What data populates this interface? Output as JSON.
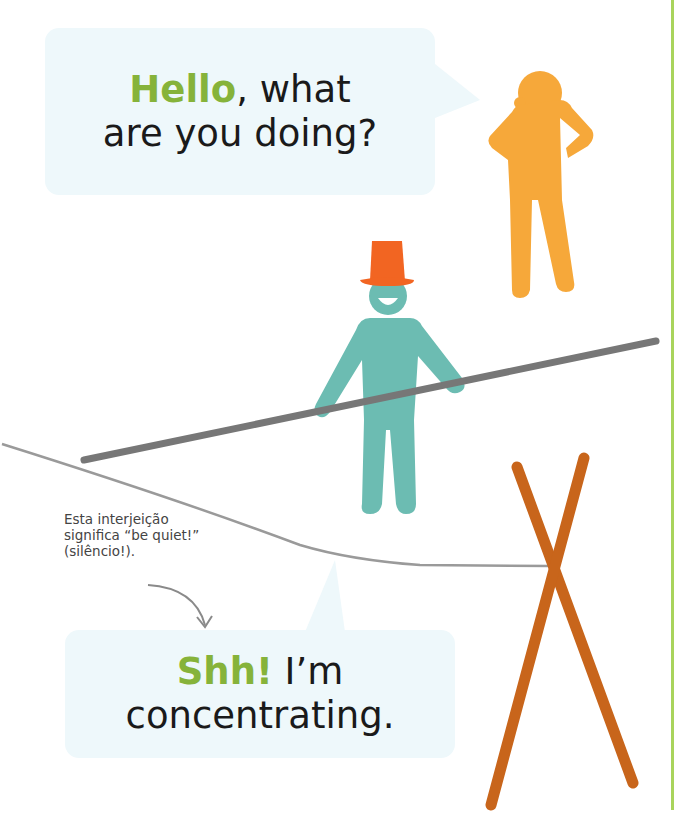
{
  "top_bubble": {
    "accent_word": "Hello",
    "line1_rest": ", what",
    "line2": "are you doing?"
  },
  "note": {
    "line1": "Esta interjeição",
    "line2": "significa “be quiet!”",
    "line3": "(silêncio!)."
  },
  "bottom_bubble": {
    "accent_word": "Shh!",
    "line1_rest": " I’m",
    "line2": "concentrating."
  },
  "colors": {
    "accent_green": "#86b33a",
    "bubble_bg": "#eef8fb",
    "orange_figure": "#f6a83a",
    "teal_figure": "#6cbcb2",
    "hat": "#f26522",
    "pole": "#777777",
    "stick": "#c8651b",
    "divider": "#a9d45c"
  }
}
